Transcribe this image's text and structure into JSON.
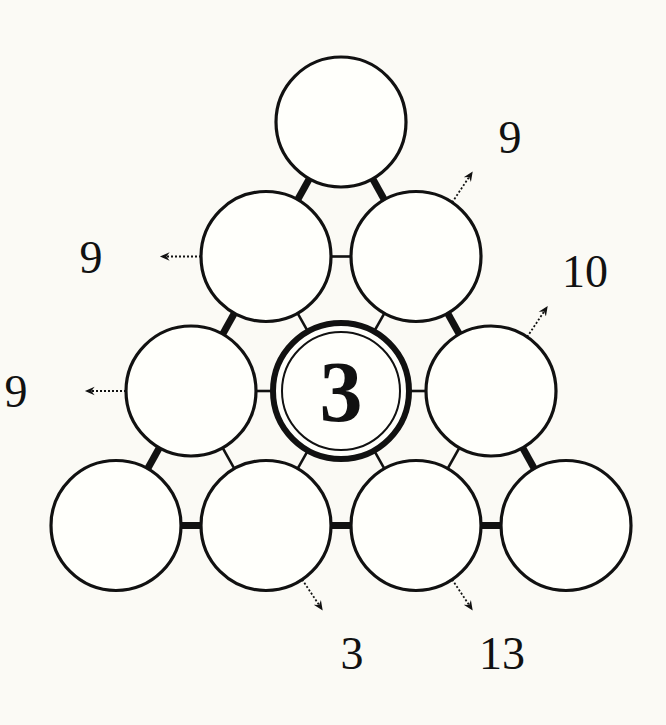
{
  "puzzle": {
    "type": "number-pyramid",
    "rows": [
      [
        {
          "id": "r1c1",
          "value": ""
        }
      ],
      [
        {
          "id": "r2c1",
          "value": ""
        },
        {
          "id": "r2c2",
          "value": ""
        }
      ],
      [
        {
          "id": "r3c1",
          "value": ""
        },
        {
          "id": "r3c2",
          "value": "3",
          "given": true
        },
        {
          "id": "r3c3",
          "value": ""
        }
      ],
      [
        {
          "id": "r4c1",
          "value": ""
        },
        {
          "id": "r4c2",
          "value": ""
        },
        {
          "id": "r4c3",
          "value": ""
        },
        {
          "id": "r4c4",
          "value": ""
        }
      ]
    ],
    "clues": [
      {
        "id": "clue-r2c2",
        "cell": "r2c2",
        "direction": "up-right",
        "value": "9"
      },
      {
        "id": "clue-r2c1",
        "cell": "r2c1",
        "direction": "left",
        "value": "9"
      },
      {
        "id": "clue-r3c3",
        "cell": "r3c3",
        "direction": "up-right",
        "value": "10"
      },
      {
        "id": "clue-r3c1",
        "cell": "r3c1",
        "direction": "left",
        "value": "9"
      },
      {
        "id": "clue-r4c2",
        "cell": "r4c2",
        "direction": "down-right",
        "value": "3"
      },
      {
        "id": "clue-r4c3",
        "cell": "r4c3",
        "direction": "down-right",
        "value": "13"
      }
    ],
    "connectors": [
      {
        "from": "r1c1",
        "to": "r2c1",
        "weight": "thick"
      },
      {
        "from": "r1c1",
        "to": "r2c2",
        "weight": "thick"
      },
      {
        "from": "r2c1",
        "to": "r2c2",
        "weight": "thin"
      },
      {
        "from": "r2c1",
        "to": "r3c1",
        "weight": "thick"
      },
      {
        "from": "r2c1",
        "to": "r3c2",
        "weight": "thin"
      },
      {
        "from": "r2c2",
        "to": "r3c2",
        "weight": "thin"
      },
      {
        "from": "r2c2",
        "to": "r3c3",
        "weight": "thick"
      },
      {
        "from": "r3c1",
        "to": "r3c2",
        "weight": "thin"
      },
      {
        "from": "r3c2",
        "to": "r3c3",
        "weight": "thin"
      },
      {
        "from": "r3c1",
        "to": "r4c1",
        "weight": "thick"
      },
      {
        "from": "r3c1",
        "to": "r4c2",
        "weight": "thin"
      },
      {
        "from": "r3c2",
        "to": "r4c2",
        "weight": "thin"
      },
      {
        "from": "r3c2",
        "to": "r4c3",
        "weight": "thin"
      },
      {
        "from": "r3c3",
        "to": "r4c3",
        "weight": "thin"
      },
      {
        "from": "r3c3",
        "to": "r4c4",
        "weight": "thick"
      },
      {
        "from": "r4c1",
        "to": "r4c2",
        "weight": "thick"
      },
      {
        "from": "r4c2",
        "to": "r4c3",
        "weight": "thick"
      },
      {
        "from": "r4c3",
        "to": "r4c4",
        "weight": "thick"
      }
    ]
  },
  "colors": {
    "background": "#fbfaf5",
    "ink": "#111111",
    "cell_fill": "#fffffb"
  }
}
